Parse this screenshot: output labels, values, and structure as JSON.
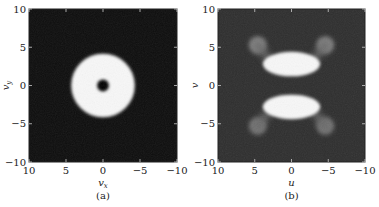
{
  "chart_data": [
    {
      "type": "heatmap",
      "panel_label": "(a)",
      "xlabel": "v",
      "xlabel_sub": "x",
      "ylabel": "v",
      "ylabel_sub": "y",
      "xlim": [
        10,
        -10
      ],
      "ylim": [
        -10,
        10
      ],
      "xticks": [
        "10",
        "5",
        "0",
        "−5",
        "−10"
      ],
      "xtick_values": [
        10,
        5,
        0,
        -5,
        -10
      ],
      "yticks": [
        "−10",
        "−5",
        "0",
        "5",
        "10"
      ],
      "ytick_values": [
        -10,
        -5,
        0,
        5,
        10
      ],
      "colormap": "gray",
      "background_value": 0.05,
      "features": [
        {
          "shape": "annulus",
          "center": [
            0,
            0
          ],
          "outer_radius": 4.3,
          "inner_radius": 0.8,
          "intensity": 0.97
        }
      ]
    },
    {
      "type": "heatmap",
      "panel_label": "(b)",
      "xlabel": "u",
      "xlabel_sub": "",
      "ylabel": "v",
      "ylabel_sub": "",
      "xlim": [
        10,
        -10
      ],
      "ylim": [
        -10,
        10
      ],
      "xticks": [
        "10",
        "5",
        "0",
        "−5",
        "−10"
      ],
      "xtick_values": [
        10,
        5,
        0,
        -5,
        -10
      ],
      "yticks": [
        "−10",
        "−5",
        "0",
        "5",
        "10"
      ],
      "ytick_values": [
        -10,
        -5,
        0,
        5,
        10
      ],
      "colormap": "gray",
      "background_value": 0.18,
      "features": [
        {
          "shape": "ellipse",
          "center": [
            0,
            2.8
          ],
          "rx": 3.9,
          "ry": 1.6,
          "intensity": 0.97
        },
        {
          "shape": "ellipse",
          "center": [
            0,
            -2.8
          ],
          "rx": 3.9,
          "ry": 1.6,
          "intensity": 0.97
        },
        {
          "shape": "blob",
          "center": [
            4.6,
            5.3
          ],
          "r": 1.2,
          "intensity": 0.5
        },
        {
          "shape": "blob",
          "center": [
            -4.6,
            5.3
          ],
          "r": 1.2,
          "intensity": 0.5
        },
        {
          "shape": "blob",
          "center": [
            4.6,
            -5.3
          ],
          "r": 1.2,
          "intensity": 0.45
        },
        {
          "shape": "blob",
          "center": [
            -4.6,
            -5.3
          ],
          "r": 1.2,
          "intensity": 0.45
        },
        {
          "shape": "arm",
          "from": [
            3.2,
            3.6
          ],
          "to": [
            4.6,
            5.3
          ],
          "intensity": 0.4
        },
        {
          "shape": "arm",
          "from": [
            -3.2,
            3.6
          ],
          "to": [
            -4.6,
            5.3
          ],
          "intensity": 0.4
        },
        {
          "shape": "arm",
          "from": [
            3.2,
            -3.6
          ],
          "to": [
            4.6,
            -5.3
          ],
          "intensity": 0.4
        },
        {
          "shape": "arm",
          "from": [
            -3.2,
            -3.6
          ],
          "to": [
            -4.6,
            -5.3
          ],
          "intensity": 0.4
        }
      ]
    }
  ]
}
